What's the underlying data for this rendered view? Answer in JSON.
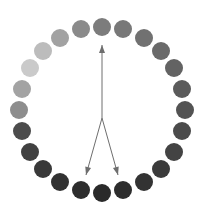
{
  "figure": {
    "width": 204,
    "height": 222,
    "background_color": "#ffffff"
  },
  "chart_data": {
    "type": "scatter",
    "title": "",
    "subtitle": "",
    "xlabel": "",
    "ylabel": "",
    "grid": false,
    "legend": null,
    "axis_visible": false,
    "tick_labels": [],
    "annotations": [],
    "ring": {
      "center_x": 102,
      "center_y": 110,
      "radius": 83,
      "dot_count": 24,
      "dot_diameter": 18,
      "gradient_description": "grayscale, lightest at upper-left (~9-10 o'clock), darkening clockwise through bottom-right",
      "lightest_color": "#cacaca",
      "darkest_color": "#282828"
    },
    "points": [
      {
        "index": 0,
        "angle_deg": -90,
        "x": 102,
        "y": 27,
        "color": "#7c7c7c",
        "gray": 124
      },
      {
        "index": 1,
        "angle_deg": -75,
        "x": 123,
        "y": 29,
        "color": "#787878",
        "gray": 120
      },
      {
        "index": 2,
        "angle_deg": -60,
        "x": 144,
        "y": 38,
        "color": "#717171",
        "gray": 113
      },
      {
        "index": 3,
        "angle_deg": -45,
        "x": 161,
        "y": 51,
        "color": "#6a6a6a",
        "gray": 106
      },
      {
        "index": 4,
        "angle_deg": -30,
        "x": 174,
        "y": 68,
        "color": "#636363",
        "gray": 99
      },
      {
        "index": 5,
        "angle_deg": -15,
        "x": 182,
        "y": 89,
        "color": "#5b5b5b",
        "gray": 91
      },
      {
        "index": 6,
        "angle_deg": 0,
        "x": 185,
        "y": 110,
        "color": "#535353",
        "gray": 83
      },
      {
        "index": 7,
        "angle_deg": 15,
        "x": 182,
        "y": 131,
        "color": "#4b4b4b",
        "gray": 75
      },
      {
        "index": 8,
        "angle_deg": 30,
        "x": 174,
        "y": 152,
        "color": "#434343",
        "gray": 67
      },
      {
        "index": 9,
        "angle_deg": 45,
        "x": 161,
        "y": 169,
        "color": "#3b3b3b",
        "gray": 59
      },
      {
        "index": 10,
        "angle_deg": 60,
        "x": 144,
        "y": 182,
        "color": "#333333",
        "gray": 51
      },
      {
        "index": 11,
        "angle_deg": 75,
        "x": 123,
        "y": 190,
        "color": "#2d2d2d",
        "gray": 45
      },
      {
        "index": 12,
        "angle_deg": 90,
        "x": 102,
        "y": 193,
        "color": "#2a2a2a",
        "gray": 42
      },
      {
        "index": 13,
        "angle_deg": 105,
        "x": 81,
        "y": 190,
        "color": "#2d2d2d",
        "gray": 45
      },
      {
        "index": 14,
        "angle_deg": 120,
        "x": 60,
        "y": 182,
        "color": "#323232",
        "gray": 50
      },
      {
        "index": 15,
        "angle_deg": 135,
        "x": 43,
        "y": 169,
        "color": "#393939",
        "gray": 57
      },
      {
        "index": 16,
        "angle_deg": 150,
        "x": 30,
        "y": 152,
        "color": "#414141",
        "gray": 65
      },
      {
        "index": 17,
        "angle_deg": 165,
        "x": 22,
        "y": 131,
        "color": "#4c4c4c",
        "gray": 76
      },
      {
        "index": 18,
        "angle_deg": 180,
        "x": 19,
        "y": 110,
        "color": "#8d8d8d",
        "gray": 141
      },
      {
        "index": 19,
        "angle_deg": 195,
        "x": 22,
        "y": 89,
        "color": "#a3a3a3",
        "gray": 163
      },
      {
        "index": 20,
        "angle_deg": 210,
        "x": 30,
        "y": 68,
        "color": "#cacaca",
        "gray": 202
      },
      {
        "index": 21,
        "angle_deg": 225,
        "x": 43,
        "y": 51,
        "color": "#bcbcbc",
        "gray": 188
      },
      {
        "index": 22,
        "angle_deg": 240,
        "x": 60,
        "y": 38,
        "color": "#a2a2a2",
        "gray": 162
      },
      {
        "index": 23,
        "angle_deg": 255,
        "x": 81,
        "y": 29,
        "color": "#8a8a8a",
        "gray": 138
      }
    ],
    "arrows": {
      "vertex_x": 102,
      "vertex_y": 118,
      "stroke_color": "#6e6e6e",
      "stroke_width": 1,
      "items": [
        {
          "name": "arrow-up",
          "direction": "up",
          "tip_x": 102,
          "tip_y": 45,
          "tail_x": 102,
          "tail_y": 118
        },
        {
          "name": "arrow-down-left",
          "direction": "down-left",
          "tip_x": 86,
          "tip_y": 175,
          "tail_x": 102,
          "tail_y": 118
        },
        {
          "name": "arrow-down-right",
          "direction": "down-right",
          "tip_x": 118,
          "tip_y": 175,
          "tail_x": 102,
          "tail_y": 118
        }
      ]
    }
  }
}
